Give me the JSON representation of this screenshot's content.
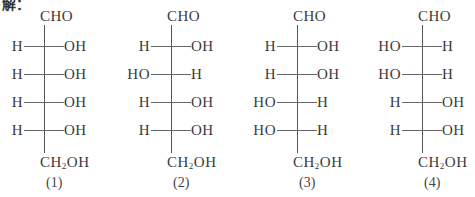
{
  "header": {
    "label": "解："
  },
  "structures": [
    {
      "id": "1",
      "top": "CHO",
      "bottom_main": "CH",
      "bottom_sub": "2",
      "bottom_tail": "OH",
      "label": "(1)",
      "rows": [
        {
          "left": "H",
          "right": "OH"
        },
        {
          "left": "H",
          "right": "OH"
        },
        {
          "left": "H",
          "right": "OH"
        },
        {
          "left": "H",
          "right": "OH"
        }
      ]
    },
    {
      "id": "2",
      "top": "CHO",
      "bottom_main": "CH",
      "bottom_sub": "2",
      "bottom_tail": "OH",
      "label": "(2)",
      "rows": [
        {
          "left": "H",
          "right": "OH"
        },
        {
          "left": "HO",
          "right": "H"
        },
        {
          "left": "H",
          "right": "OH"
        },
        {
          "left": "H",
          "right": "OH"
        }
      ]
    },
    {
      "id": "3",
      "top": "CHO",
      "bottom_main": "CH",
      "bottom_sub": "2",
      "bottom_tail": "OH",
      "label": "(3)",
      "rows": [
        {
          "left": "H",
          "right": "OH"
        },
        {
          "left": "H",
          "right": "OH"
        },
        {
          "left": "HO",
          "right": "H"
        },
        {
          "left": "HO",
          "right": "H"
        }
      ]
    },
    {
      "id": "4",
      "top": "CHO",
      "bottom_main": "CH",
      "bottom_sub": "2",
      "bottom_tail": "OH",
      "label": "(4)",
      "rows": [
        {
          "left": "HO",
          "right": "H"
        },
        {
          "left": "HO",
          "right": "H"
        },
        {
          "left": "H",
          "right": "OH"
        },
        {
          "left": "H",
          "right": "OH"
        }
      ]
    }
  ]
}
